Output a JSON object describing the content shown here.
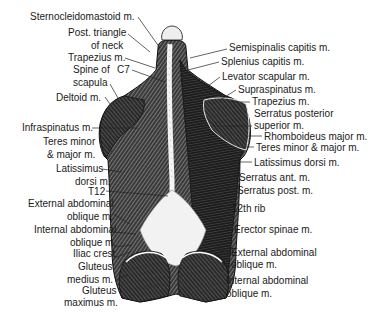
{
  "figure": {
    "left_labels": [
      {
        "id": "sternocleidomastoid",
        "text": "Sternocleidomastoid m.",
        "x": 30,
        "y": 11
      },
      {
        "id": "post-triangle",
        "text": "Post. triangle",
        "x": 68,
        "y": 27
      },
      {
        "id": "post-triangle-2",
        "text": "of neck",
        "x": 91,
        "y": 40
      },
      {
        "id": "trapezius-left",
        "text": "Trapezius m.",
        "x": 68,
        "y": 52
      },
      {
        "id": "spine-of-scapula",
        "text": "Spine of",
        "x": 73,
        "y": 64
      },
      {
        "id": "c7",
        "text": "C7",
        "x": 117,
        "y": 64
      },
      {
        "id": "spine-of-scapula-2",
        "text": "scapula",
        "x": 73,
        "y": 77
      },
      {
        "id": "deltoid",
        "text": "Deltoid m.",
        "x": 56,
        "y": 92
      },
      {
        "id": "infraspinatus",
        "text": "Infraspinatus m.",
        "x": 22,
        "y": 122
      },
      {
        "id": "teres-left",
        "text": "Teres minor",
        "x": 43,
        "y": 136
      },
      {
        "id": "teres-left-2",
        "text": "& major m.",
        "x": 47,
        "y": 149
      },
      {
        "id": "latissimus-left",
        "text": "Latissimus",
        "x": 56,
        "y": 163
      },
      {
        "id": "latissimus-left-2",
        "text": "dorsi m.",
        "x": 75,
        "y": 176
      },
      {
        "id": "t12",
        "text": "T12",
        "x": 88,
        "y": 187
      },
      {
        "id": "ext-oblique-left",
        "text": "External abdominal",
        "x": 28,
        "y": 199
      },
      {
        "id": "ext-oblique-left-2",
        "text": "oblique m.",
        "x": 67,
        "y": 213
      },
      {
        "id": "int-oblique-left",
        "text": "Internal abdominal",
        "x": 34,
        "y": 225
      },
      {
        "id": "int-oblique-left-2",
        "text": "oblique m.",
        "x": 70,
        "y": 239
      },
      {
        "id": "iliac-crest",
        "text": "Iliac crest",
        "x": 73,
        "y": 250
      },
      {
        "id": "gluteus-medius",
        "text": "Gluteus",
        "x": 78,
        "y": 263
      },
      {
        "id": "gluteus-medius-2",
        "text": "medius m.",
        "x": 67,
        "y": 276
      },
      {
        "id": "gluteus-maximus",
        "text": "Gluteus",
        "x": 82,
        "y": 286
      },
      {
        "id": "gluteus-maximus-2",
        "text": "maximus m.",
        "x": 64,
        "y": 299
      }
    ],
    "right_labels": [
      {
        "id": "semispinalis",
        "text": "Semispinalis capitis m.",
        "x": 229,
        "y": 43
      },
      {
        "id": "splenius",
        "text": "Splenius capitis m.",
        "x": 221,
        "y": 56
      },
      {
        "id": "levator",
        "text": "Levator scapular m.",
        "x": 222,
        "y": 71
      },
      {
        "id": "supraspinatus",
        "text": "Supraspinatus m.",
        "x": 238,
        "y": 84
      },
      {
        "id": "trapezius-right",
        "text": "Trapezius m.",
        "x": 252,
        "y": 96
      },
      {
        "id": "serratus-post-sup",
        "text": "Serratus posterior",
        "x": 254,
        "y": 108
      },
      {
        "id": "serratus-post-sup-2",
        "text": "superior m.",
        "x": 254,
        "y": 121
      },
      {
        "id": "rhomboideus",
        "text": "Rhomboideus major m.",
        "x": 264,
        "y": 131
      },
      {
        "id": "teres-right",
        "text": "Teres minor & major m.",
        "x": 256,
        "y": 142
      },
      {
        "id": "latissimus-right",
        "text": "Latissimus dorsi m.",
        "x": 254,
        "y": 157
      },
      {
        "id": "serratus-ant",
        "text": "Serratus ant. m.",
        "x": 239,
        "y": 172
      },
      {
        "id": "serratus-post",
        "text": "Serratus post. m.",
        "x": 237,
        "y": 185
      },
      {
        "id": "12th-rib",
        "text": "12th rib",
        "x": 232,
        "y": 203
      },
      {
        "id": "erector-spinae",
        "text": "Erector spinae m.",
        "x": 234,
        "y": 225
      },
      {
        "id": "ext-oblique-right",
        "text": "External abdominal",
        "x": 231,
        "y": 247
      },
      {
        "id": "ext-oblique-right-2",
        "text": "oblique m.",
        "x": 231,
        "y": 260
      },
      {
        "id": "int-oblique-right",
        "text": "Internal abdominal",
        "x": 226,
        "y": 275
      },
      {
        "id": "int-oblique-right-2",
        "text": "oblique m.",
        "x": 226,
        "y": 288
      }
    ],
    "signature": "Gilbert"
  }
}
